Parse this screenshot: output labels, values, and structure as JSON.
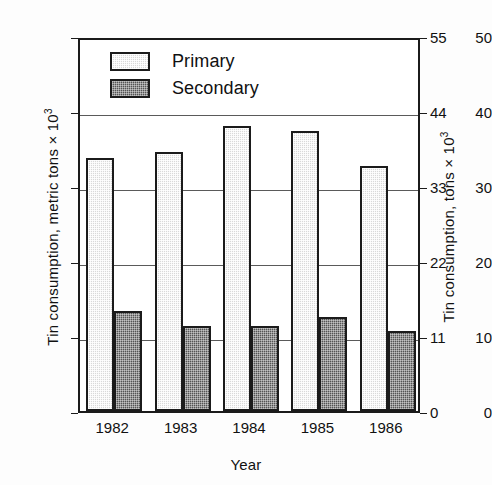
{
  "chart_data": {
    "type": "bar",
    "title": "",
    "categories": [
      "1982",
      "1983",
      "1984",
      "1985",
      "1986"
    ],
    "series": [
      {
        "name": "Primary",
        "values": [
          33.8,
          34.5,
          38.0,
          37.3,
          32.7
        ]
      },
      {
        "name": "Secondary",
        "values": [
          13.4,
          11.4,
          11.4,
          12.6,
          10.7
        ]
      }
    ],
    "xlabel": "Year",
    "ylabel": "Tin consumption, metric tons × 10",
    "ylabel_sup": "3",
    "ylabel_right": "Tin consumption, tons × 10",
    "ylabel_right_sup": "3",
    "ylim": [
      0,
      50
    ],
    "ylim_right": [
      0,
      55
    ],
    "yticks": [
      "0",
      "10",
      "20",
      "30",
      "40",
      "50"
    ],
    "yticks_right": [
      "0",
      "11",
      "22",
      "33",
      "44",
      "55"
    ],
    "grid": true,
    "grid_values": [
      10,
      20,
      30,
      40
    ],
    "legend_position": "top-left",
    "colors": {
      "primary_fill": "#d9d9d9",
      "secondary_fill": "#545454",
      "outline": "#1b1b1b",
      "grid": "#5a5a5a",
      "background": "#ffffff"
    }
  },
  "legend": {
    "items": [
      {
        "label": "Primary",
        "swatch": "primary"
      },
      {
        "label": "Secondary",
        "swatch": "secondary"
      }
    ]
  }
}
